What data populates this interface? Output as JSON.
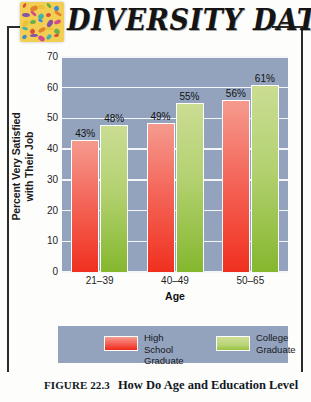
{
  "header": {
    "logo_icon": "diversity-mosaic-icon",
    "banner_title": "DIVERSITY DATA"
  },
  "chart_data": {
    "type": "bar",
    "title": "",
    "categories": [
      "21–39",
      "40–49",
      "50–65"
    ],
    "series": [
      {
        "name": "High School Graduate",
        "values": [
          43,
          48.5,
          56
        ],
        "color": "#f0301f",
        "labels": [
          "43%",
          "49%",
          "56%"
        ]
      },
      {
        "name": "College Graduate",
        "values": [
          48,
          55,
          61
        ],
        "color": "#85b72e",
        "labels": [
          "48%",
          "55%",
          "61%"
        ]
      }
    ],
    "xlabel": "Age",
    "ylabel": "Percent Very Satisfied\nwith Their Job",
    "ylim": [
      0,
      70
    ],
    "yticks": [
      "70",
      "60",
      "50",
      "40",
      "30",
      "20",
      "10",
      "0"
    ],
    "grid": true,
    "legend_position": "bottom",
    "plot_background": "#93a3bd"
  },
  "axis": {
    "y_title_line1": "Percent Very Satisfied",
    "y_title_line2": "with Their Job",
    "x_title": "Age"
  },
  "legend": {
    "items": [
      {
        "label": "High School\nGraduate",
        "swatch": "hs"
      },
      {
        "label": "College\nGraduate",
        "swatch": "col"
      }
    ]
  },
  "caption": {
    "figure_number": "FIGURE 22.3",
    "text": "How Do Age and Education Level"
  }
}
